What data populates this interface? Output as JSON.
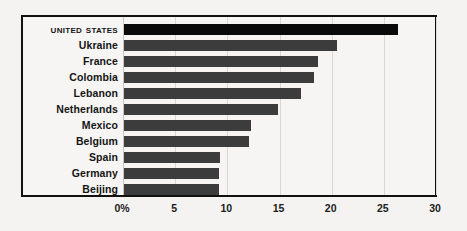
{
  "chart_data": {
    "type": "bar",
    "orientation": "horizontal",
    "title": "",
    "subtitle": "",
    "xlabel": "",
    "ylabel": "",
    "xlim": [
      0,
      30
    ],
    "xticks": [
      0,
      5,
      10,
      15,
      20,
      25,
      30
    ],
    "xtick_labels": [
      "0%",
      "5",
      "10",
      "15",
      "20",
      "25",
      "30"
    ],
    "grid": true,
    "legend": "none",
    "highlight_category": "United States",
    "categories": [
      "United States",
      "Ukraine",
      "France",
      "Colombia",
      "Lebanon",
      "Netherlands",
      "Mexico",
      "Belgium",
      "Spain",
      "Germany",
      "Beijing"
    ],
    "values": [
      26.3,
      20.4,
      18.6,
      18.2,
      17.0,
      14.8,
      12.2,
      12.0,
      9.2,
      9.1,
      9.1
    ],
    "bars": [
      {
        "label": "United States",
        "value": 26.3,
        "highlight": true
      },
      {
        "label": "Ukraine",
        "value": 20.4,
        "highlight": false
      },
      {
        "label": "France",
        "value": 18.6,
        "highlight": false
      },
      {
        "label": "Colombia",
        "value": 18.2,
        "highlight": false
      },
      {
        "label": "Lebanon",
        "value": 17.0,
        "highlight": false
      },
      {
        "label": "Netherlands",
        "value": 14.8,
        "highlight": false
      },
      {
        "label": "Mexico",
        "value": 12.2,
        "highlight": false
      },
      {
        "label": "Belgium",
        "value": 12.0,
        "highlight": false
      },
      {
        "label": "Spain",
        "value": 9.2,
        "highlight": false
      },
      {
        "label": "Germany",
        "value": 9.1,
        "highlight": false
      },
      {
        "label": "Beijing",
        "value": 9.1,
        "highlight": false
      }
    ],
    "colors": {
      "bar": "#3c3c3c",
      "bar_highlight": "#0a0a0a",
      "background": "#f4f3f1",
      "plot_background": "#f6f5f3",
      "frame": "#111111",
      "gridline": "#d8d7d4",
      "text": "#141414"
    }
  }
}
